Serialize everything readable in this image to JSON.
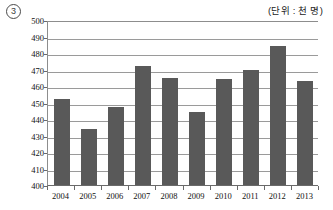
{
  "figure": {
    "marker_number": "3",
    "unit_caption": "(단위 : 천 명)"
  },
  "chart_data": {
    "type": "bar",
    "title": "",
    "subtitle": "",
    "xlabel": "",
    "ylabel": "",
    "unit_note": "(단위 : 천 명)",
    "categories": [
      "2004",
      "2005",
      "2006",
      "2007",
      "2008",
      "2009",
      "2010",
      "2011",
      "2012",
      "2013"
    ],
    "values": [
      452,
      434,
      447,
      472,
      465,
      444,
      464,
      470,
      484,
      463
    ],
    "series": [
      {
        "name": "",
        "values": [
          452,
          434,
          447,
          472,
          465,
          444,
          464,
          470,
          484,
          463
        ]
      }
    ],
    "ylim": [
      400,
      500
    ],
    "ytick_step": 10,
    "ytick_labels": [
      "500",
      "490",
      "480",
      "470",
      "460",
      "450",
      "440",
      "430",
      "420",
      "410",
      "400"
    ],
    "grid": true,
    "grid_axis": "y",
    "legend": false,
    "legend_position": "none",
    "bar_color": "#595959",
    "grid_color": "#9a9a9a",
    "axis_color": "#6a6a6a",
    "annotations": [
      "3"
    ]
  }
}
